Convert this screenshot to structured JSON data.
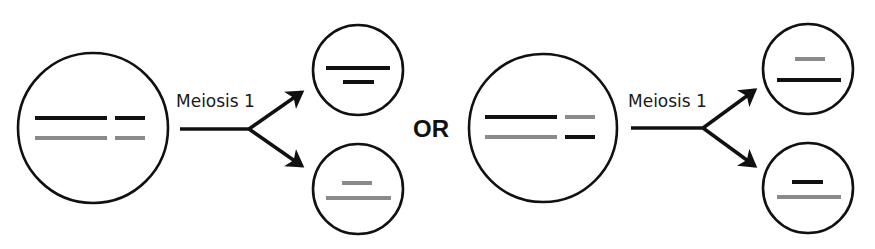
{
  "colors": {
    "outline": "#111111",
    "black_chromosome": "#111111",
    "gray_chromosome": "#8a8a8a",
    "background": "#ffffff"
  },
  "labels": {
    "left_process": "Meiosis 1",
    "separator": "OR",
    "right_process": "Meiosis 1"
  },
  "scenarios": [
    {
      "name": "scenario-1",
      "parent_cell": {
        "row1": [
          "black-long",
          "black-short"
        ],
        "row2": [
          "gray-long",
          "gray-short"
        ]
      },
      "daughter_top": [
        "black-long",
        "black-short"
      ],
      "daughter_bottom": [
        "gray-short",
        "gray-long"
      ]
    },
    {
      "name": "scenario-2",
      "parent_cell": {
        "row1": [
          "black-long",
          "gray-short"
        ],
        "row2": [
          "gray-long",
          "black-short"
        ]
      },
      "daughter_top": [
        "gray-short",
        "black-long"
      ],
      "daughter_bottom": [
        "black-short",
        "gray-long"
      ]
    }
  ]
}
